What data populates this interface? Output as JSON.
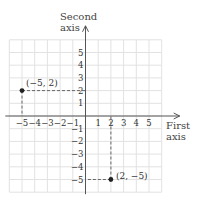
{
  "chart_data": {
    "type": "scatter",
    "title": "",
    "xlabel": "First axis",
    "ylabel": "Second axis",
    "xlabel_lines": [
      "First",
      "axis"
    ],
    "ylabel_lines": [
      "Second",
      "axis"
    ],
    "xlim": [
      -6,
      6
    ],
    "ylim": [
      -6,
      6
    ],
    "grid": true,
    "x_ticks": [
      -5,
      -4,
      -3,
      -2,
      -1,
      1,
      2,
      3,
      4,
      5
    ],
    "y_ticks": [
      -5,
      -4,
      -3,
      -2,
      -1,
      1,
      2,
      3,
      4,
      5
    ],
    "x_tick_labels": [
      "−5",
      "−4",
      "−3",
      "−2",
      "−1",
      "1",
      "2",
      "3",
      "4",
      "5"
    ],
    "y_tick_labels": [
      "−5",
      "−4",
      "−3",
      "−2",
      "−1",
      "1",
      "2",
      "3",
      "4",
      "5"
    ],
    "points": [
      {
        "x": -5,
        "y": 2,
        "label": "(−5, 2)",
        "label_position": "above-right"
      },
      {
        "x": 2,
        "y": -5,
        "label": "(2, −5)",
        "label_position": "right"
      }
    ],
    "guide_lines": "dashed projections from each point to both axes"
  },
  "colors": {
    "grid": "#e2e2e2",
    "axis": "#555555",
    "point": "#222222",
    "dash": "#666666",
    "text": "#333333"
  }
}
